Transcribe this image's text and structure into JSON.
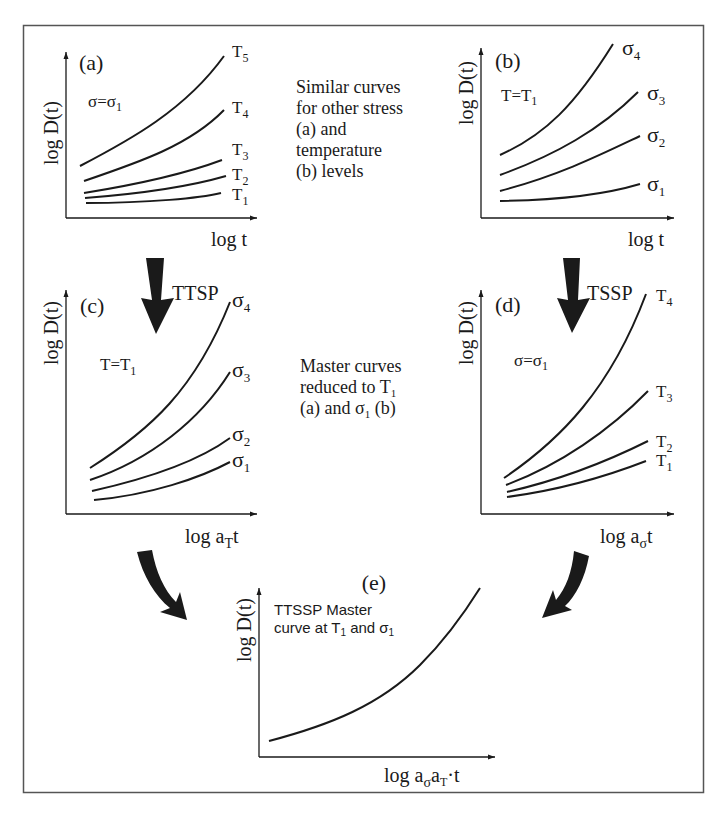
{
  "figure": {
    "panels": {
      "a": {
        "tag": "(a)",
        "condition": "σ=σ",
        "condition_sub": "1",
        "ylabel": "log D(t)",
        "xlabel": "log t",
        "curve_labels": [
          {
            "main": "T",
            "sub": "5"
          },
          {
            "main": "T",
            "sub": "4"
          },
          {
            "main": "T",
            "sub": "3"
          },
          {
            "main": "T",
            "sub": "2"
          },
          {
            "main": "T",
            "sub": "1"
          }
        ]
      },
      "b": {
        "tag": "(b)",
        "condition": "T=T",
        "condition_sub": "1",
        "ylabel": "log D(t)",
        "xlabel": "log t",
        "curve_labels": [
          {
            "main": "σ",
            "sub": "4"
          },
          {
            "main": "σ",
            "sub": "3"
          },
          {
            "main": "σ",
            "sub": "2"
          },
          {
            "main": "σ",
            "sub": "1"
          }
        ]
      },
      "c": {
        "tag": "(c)",
        "condition": "T=T",
        "condition_sub": "1",
        "ylabel": "log D(t)",
        "xlabel_main": "log a",
        "xlabel_sub": "T",
        "xlabel_tail": "t",
        "curve_labels": [
          {
            "main": "σ",
            "sub": "4"
          },
          {
            "main": "σ",
            "sub": "3"
          },
          {
            "main": "σ",
            "sub": "2"
          },
          {
            "main": "σ",
            "sub": "1"
          }
        ]
      },
      "d": {
        "tag": "(d)",
        "condition": "σ=σ",
        "condition_sub": "1",
        "ylabel": "log D(t)",
        "xlabel_main": "log a",
        "xlabel_sub": "σ",
        "xlabel_tail": "t",
        "curve_labels": [
          {
            "main": "T",
            "sub": "4"
          },
          {
            "main": "T",
            "sub": "3"
          },
          {
            "main": "T",
            "sub": "2"
          },
          {
            "main": "T",
            "sub": "1"
          }
        ]
      },
      "e": {
        "tag": "(e)",
        "note_line1": "TTSSP Master",
        "note_line2_a": "curve at T",
        "note_line2_sub1": "1",
        "note_line2_b": " and σ",
        "note_line2_sub2": "1",
        "ylabel": "log D(t)",
        "xlabel_main": "log a",
        "xlabel_sub1": "σ",
        "xlabel_mid": "a",
        "xlabel_sub2": "T",
        "xlabel_tail": "t"
      }
    },
    "arrows": {
      "ttsp_label": "TTSP",
      "tssp_label": "TSSP"
    },
    "captions": {
      "top": [
        "Similar curves",
        "for other stress",
        "(a) and",
        "temperature",
        "(b) levels"
      ],
      "middle_line1": "Master curves",
      "middle_line2": "reduced to T",
      "middle_line2_sub": "1",
      "middle_line3_a": "(a) and σ",
      "middle_line3_sub": "1",
      "middle_line3_b": " (b)"
    },
    "colors": {
      "line": "#1a1a1a",
      "border": "#555555",
      "background": "#ffffff"
    }
  }
}
